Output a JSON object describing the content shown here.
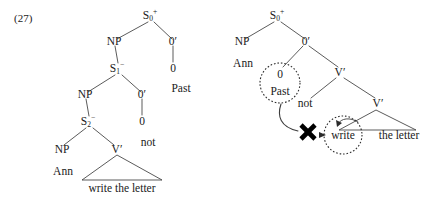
{
  "figure": {
    "example_number": "(27)",
    "background_color": "#ffffff",
    "ink_color": "#1a1a1a"
  },
  "left_tree": {
    "name": "underlying-structure-tree",
    "nodes": {
      "s0": {
        "label": "S",
        "subscript": "0",
        "superscript": "+"
      },
      "np1": {
        "label": "NP"
      },
      "o_prime_1": {
        "label": "0′"
      },
      "zero_1": {
        "label": "0"
      },
      "past": {
        "label": "Past"
      },
      "s1": {
        "label": "S",
        "subscript": "1",
        "superscript": "−"
      },
      "np2": {
        "label": "NP"
      },
      "o_prime_2": {
        "label": "0′"
      },
      "zero_2": {
        "label": "0"
      },
      "not": {
        "label": "not"
      },
      "s2": {
        "label": "S",
        "subscript": "2",
        "superscript": "−"
      },
      "np3": {
        "label": "NP"
      },
      "ann": {
        "label": "Ann"
      },
      "v_prime": {
        "label": "V′"
      },
      "vp_string": {
        "label": "write the letter"
      }
    }
  },
  "right_tree": {
    "name": "derived-structure-tree",
    "nodes": {
      "s0": {
        "label": "S",
        "subscript": "0",
        "superscript": "+"
      },
      "np": {
        "label": "NP"
      },
      "ann": {
        "label": "Ann"
      },
      "o_prime": {
        "label": "0′"
      },
      "zero": {
        "label": "0"
      },
      "past": {
        "label": "Past"
      },
      "v_prime_upper": {
        "label": "V′"
      },
      "not": {
        "label": "not"
      },
      "v_prime_lower": {
        "label": "V′"
      },
      "write": {
        "label": "write"
      },
      "the_letter": {
        "label": "the letter"
      }
    },
    "annotations": {
      "blocked_movement_marker": "✖",
      "circled_source": "Past",
      "circled_target": "write"
    }
  }
}
